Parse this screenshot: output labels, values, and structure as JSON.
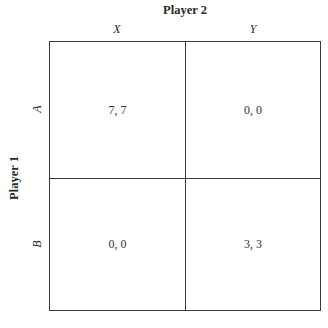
{
  "player_column": {
    "label": "Player 2",
    "strategies": [
      "X",
      "Y"
    ]
  },
  "player_row": {
    "label": "Player 1",
    "strategies": [
      "A",
      "B"
    ]
  },
  "payoffs": {
    "A_X": "7, 7",
    "A_Y": "0, 0",
    "B_X": "0, 0",
    "B_Y": "3, 3"
  },
  "colors": {
    "background": "#ffffff",
    "lines": "#3a3a3a",
    "text": "#2a2a2a"
  }
}
